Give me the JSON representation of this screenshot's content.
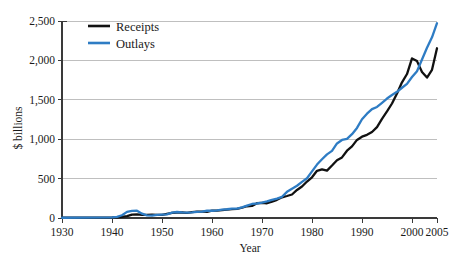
{
  "chart_data": {
    "type": "line",
    "title": "",
    "xlabel": "Year",
    "ylabel": "$ billions",
    "xlim": [
      1930,
      2005
    ],
    "ylim": [
      0,
      2500
    ],
    "grid": true,
    "legend_position": "top-left-inside",
    "xticks": [
      1930,
      1940,
      1950,
      1960,
      1970,
      1980,
      1990,
      2000,
      2005
    ],
    "xtick_labels": [
      "1930",
      "1940",
      "1950",
      "1960",
      "1970",
      "1980",
      "1990",
      "2000",
      "2005"
    ],
    "yticks": [
      0,
      500,
      1000,
      1500,
      2000,
      2500
    ],
    "ytick_labels": [
      "0",
      "500",
      "1,000",
      "1,500",
      "2,000",
      "2,500"
    ],
    "x": [
      1930,
      1935,
      1940,
      1941,
      1942,
      1943,
      1944,
      1945,
      1946,
      1947,
      1948,
      1949,
      1950,
      1951,
      1952,
      1953,
      1954,
      1955,
      1956,
      1957,
      1958,
      1959,
      1960,
      1961,
      1962,
      1963,
      1964,
      1965,
      1966,
      1967,
      1968,
      1969,
      1970,
      1971,
      1972,
      1973,
      1974,
      1975,
      1976,
      1977,
      1978,
      1979,
      1980,
      1981,
      1982,
      1983,
      1984,
      1985,
      1986,
      1987,
      1988,
      1989,
      1990,
      1991,
      1992,
      1993,
      1994,
      1995,
      1996,
      1997,
      1998,
      1999,
      2000,
      2001,
      2002,
      2003,
      2004,
      2005
    ],
    "series": [
      {
        "name": "Receipts",
        "color": "#111111",
        "values": [
          4,
          4,
          7,
          9,
          15,
          24,
          44,
          45,
          39,
          39,
          42,
          39,
          39,
          52,
          66,
          70,
          70,
          65,
          75,
          80,
          80,
          79,
          93,
          94,
          100,
          107,
          113,
          117,
          131,
          149,
          153,
          187,
          193,
          187,
          207,
          231,
          263,
          279,
          298,
          356,
          400,
          463,
          517,
          599,
          618,
          601,
          666,
          734,
          769,
          854,
          909,
          991,
          1032,
          1055,
          1091,
          1154,
          1259,
          1352,
          1453,
          1579,
          1722,
          1827,
          2025,
          1991,
          1853,
          1782,
          1880,
          2154
        ],
        "style": "solid",
        "width": 2.3
      },
      {
        "name": "Outlays",
        "color": "#2e7cc4",
        "values": [
          3,
          6,
          9,
          14,
          35,
          78,
          91,
          93,
          55,
          34,
          30,
          39,
          43,
          46,
          68,
          76,
          71,
          68,
          71,
          77,
          82,
          92,
          92,
          98,
          107,
          111,
          119,
          118,
          135,
          157,
          178,
          184,
          196,
          210,
          231,
          246,
          269,
          332,
          372,
          409,
          459,
          504,
          591,
          678,
          746,
          808,
          852,
          946,
          990,
          1004,
          1064,
          1143,
          1253,
          1324,
          1382,
          1409,
          1462,
          1516,
          1561,
          1601,
          1653,
          1702,
          1789,
          1863,
          2011,
          2160,
          2293,
          2472
        ],
        "style": "solid",
        "width": 2.3
      }
    ],
    "legend": [
      {
        "label": "Receipts",
        "color": "#111111"
      },
      {
        "label": "Outlays",
        "color": "#2e7cc4"
      }
    ]
  }
}
